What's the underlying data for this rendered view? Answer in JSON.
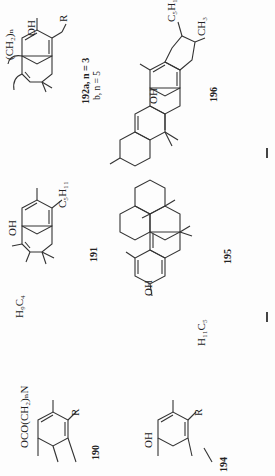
{
  "page": {
    "orientation": "rotated-90",
    "compounds": [
      {
        "id": "190",
        "label": "190",
        "substituents": [
          "OCO(CH2)nN< >",
          "R"
        ]
      },
      {
        "id": "191",
        "label": "191",
        "substituents": [
          "OH",
          "C5H11",
          "H9C4"
        ]
      },
      {
        "id": "192",
        "label": "192a, n = 3",
        "label_b": "b, n = 5",
        "substituents": [
          "(CH2)n",
          "OH",
          "R"
        ]
      },
      {
        "id": "194",
        "label": "194",
        "substituents": [
          "OH",
          "R"
        ]
      },
      {
        "id": "195",
        "label": "195",
        "substituents": [
          "OH",
          "H11C5"
        ]
      },
      {
        "id": "196",
        "label": "196",
        "substituents": [
          "OH",
          "C5H11",
          "CH3"
        ]
      }
    ],
    "text": {
      "c190_sub": "OCO(CH₂)ₙN",
      "c190_r": "R",
      "c190_num": "190",
      "c191_oh": "OH",
      "c191_c5": "C₅H₁₁",
      "c191_h9": "H₉C₄",
      "c191_num": "191",
      "c192_ch2": "(CH₂)ₙ",
      "c192_oh": "OH",
      "c192_r": "R",
      "c192_num_a": "192a, n = 3",
      "c192_num_b": "b, n = 5",
      "c194_oh": "OH",
      "c194_r": "R",
      "c194_num": "194",
      "c195_oh": "OH",
      "c195_h11": "H₁₁C₅",
      "c195_num": "195",
      "c196_oh": "OH",
      "c196_c5": "C₅H₁₁",
      "c196_ch3": "CH₃",
      "c196_num": "196"
    }
  }
}
